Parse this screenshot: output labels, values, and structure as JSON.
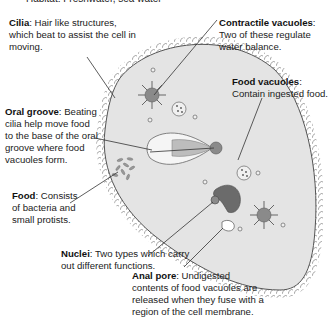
{
  "diagram": {
    "habitat_line": "Habitat: Freshwater, sea water",
    "colors": {
      "cell_fill": "#e4e4e4",
      "cell_outline": "#555555",
      "organelle_fill": "#8a8a8a",
      "macronucleus_fill": "#6b6b6b",
      "leader_line": "#333333",
      "text": "#222222"
    },
    "labels": [
      {
        "id": "cilia",
        "term": "Cilia",
        "desc": "Hair like structures, which beat to assist the cell in moving."
      },
      {
        "id": "contractile-vacuoles",
        "term": "Contractile vacuoles",
        "desc": "Two of these regulate water balance."
      },
      {
        "id": "food-vacuoles",
        "term": "Food vacuoles",
        "desc": "Contain ingested food."
      },
      {
        "id": "oral-groove",
        "term": "Oral groove",
        "desc": "Beating cilia help move food to the base of the oral groove where food vacuoles form."
      },
      {
        "id": "food",
        "term": "Food",
        "desc": "Consists of bacteria and small protists."
      },
      {
        "id": "nuclei",
        "term": "Nuclei",
        "desc": "Two types which carry out different functions."
      },
      {
        "id": "anal-pore",
        "term": "Anal pore",
        "desc": "Undigested contents of food vacuoles are released when they fuse with a region of the cell membrane."
      }
    ]
  }
}
